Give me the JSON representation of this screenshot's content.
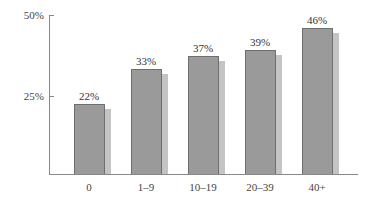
{
  "chart_data": {
    "type": "bar",
    "title": "",
    "xlabel": "",
    "ylabel": "",
    "categories": [
      "0",
      "1–9",
      "10–19",
      "20–39",
      "40+"
    ],
    "values": [
      22,
      33,
      37,
      39,
      46
    ],
    "value_labels": [
      "22%",
      "33%",
      "37%",
      "39%",
      "46%"
    ],
    "yticks": [
      {
        "value": 25,
        "label": "25%"
      },
      {
        "value": 50,
        "label": "50%"
      }
    ],
    "ylim": [
      0,
      50
    ],
    "grid": false,
    "legend": null,
    "colors": {
      "bar": "#9a9a9a",
      "bar_border": "#6e6e6e",
      "shadow": "#c4c4c4",
      "axis": "#888888"
    }
  }
}
